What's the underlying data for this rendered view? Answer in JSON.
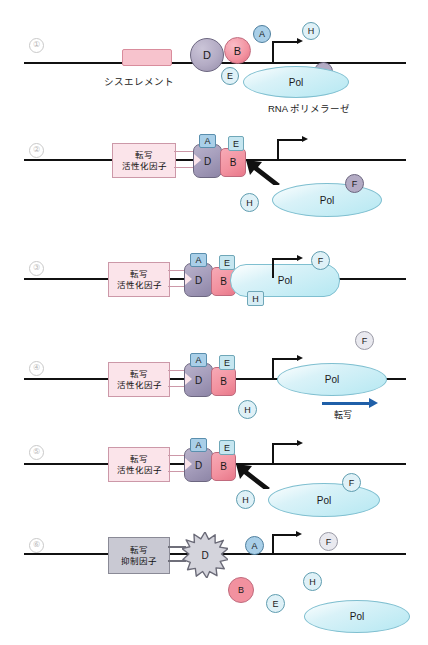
{
  "diagram": {
    "title_text": "",
    "subunit_labels": {
      "d": "D",
      "b": "B",
      "a": "A",
      "e": "E",
      "f": "F",
      "h": "H",
      "pol": "Pol"
    },
    "terms": {
      "cis_element": "シスエレメント",
      "rna_polymerase": "RNA ポリメラーゼ",
      "activator_line1": "転写",
      "activator_line2": "活性化因子",
      "repressor_line1": "転写",
      "repressor_line2": "抑制因子",
      "transcription": "転写"
    },
    "colors": {
      "dna": "#111111",
      "cis_element": "#f7c3cd",
      "activator_box": "#fbe4ea",
      "repressor_box": "#c9c9d3",
      "subunit_d": "#a79fbd",
      "subunit_b": "#f2919f",
      "subunit_a": "#a9cfe8",
      "subunit_e": "#c6e6f0",
      "polymerase": "#b5e8f2",
      "transcription_arrow": "#1f5fa8"
    },
    "panels": [
      {
        "number": "①",
        "has_cis_element": true,
        "has_factor_box": false,
        "free_circles": [
          "D",
          "B",
          "A",
          "E",
          "F",
          "H"
        ],
        "pol_shape": "ellipse",
        "pol_label": "Pol",
        "caption": "RNA ポリメラーゼ"
      },
      {
        "number": "②",
        "has_cis_element": false,
        "has_factor_box": true,
        "factor_type": "activator",
        "complex": [
          "D",
          "A",
          "B",
          "E"
        ],
        "free_circles": [
          "F",
          "H"
        ],
        "pol_shape": "ellipse",
        "pol_label": "Pol",
        "recruit_arrow": true
      },
      {
        "number": "③",
        "has_cis_element": false,
        "has_factor_box": true,
        "factor_type": "activator",
        "complex": [
          "D",
          "A",
          "B",
          "E",
          "H"
        ],
        "free_circles": [
          "F"
        ],
        "pol_shape": "pill",
        "pol_label": "Pol",
        "recruit_arrow": false
      },
      {
        "number": "④",
        "has_cis_element": false,
        "has_factor_box": true,
        "factor_type": "activator",
        "complex": [
          "D",
          "A",
          "B",
          "E"
        ],
        "free_circles": [
          "F",
          "H"
        ],
        "pol_shape": "ellipse",
        "pol_label": "Pol",
        "transcription_arrow": true,
        "transcription_label": "転写"
      },
      {
        "number": "⑤",
        "has_cis_element": false,
        "has_factor_box": true,
        "factor_type": "activator",
        "complex": [
          "D",
          "A",
          "B",
          "E"
        ],
        "free_circles": [
          "F",
          "H"
        ],
        "pol_shape": "ellipse",
        "pol_label": "Pol",
        "recruit_arrow": true
      },
      {
        "number": "⑥",
        "has_cis_element": false,
        "has_factor_box": true,
        "factor_type": "repressor",
        "complex": [
          "D"
        ],
        "burst": true,
        "free_circles": [
          "A",
          "B",
          "E",
          "F",
          "H"
        ],
        "pol_shape": "ellipse",
        "pol_label": "Pol"
      }
    ]
  }
}
